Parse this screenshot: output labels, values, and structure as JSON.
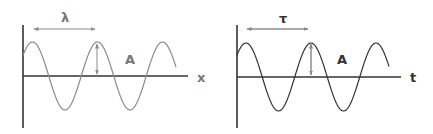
{
  "panels": [
    {
      "name": "spatial-wave",
      "axis_label": "x",
      "period_label": "λ",
      "amplitude_label": "A"
    },
    {
      "name": "temporal-wave",
      "axis_label": "t",
      "period_label": "τ",
      "amplitude_label": "A"
    }
  ],
  "colors": {
    "axis": "#333333",
    "wave": "#8a8a8a",
    "arrow": "#8a8a8a",
    "label": "#777777"
  }
}
